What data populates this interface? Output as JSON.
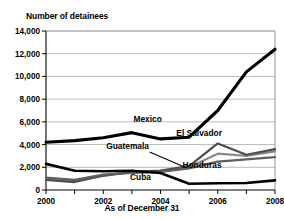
{
  "chart_data": {
    "type": "line",
    "title": "",
    "ylabel": "Number of detainees",
    "xlabel": "As of December 31",
    "x": [
      2000,
      2001,
      2002,
      2003,
      2004,
      2005,
      2006,
      2007,
      2008
    ],
    "x_tick_labels": [
      "2000",
      "2001",
      "2002",
      "2003",
      "2004",
      "2005",
      "2006",
      "2007",
      "2008"
    ],
    "x_tick_labels_shown": [
      "2000",
      "2002",
      "2004",
      "2006",
      "2008"
    ],
    "xlim": [
      2000,
      2008
    ],
    "ylim": [
      0,
      14000
    ],
    "y_ticks": [
      0,
      2000,
      4000,
      6000,
      8000,
      10000,
      12000,
      14000
    ],
    "y_tick_labels": [
      "0",
      "2,000",
      "4,000",
      "6,000",
      "8,000",
      "10,000",
      "12,000",
      "14,000"
    ],
    "grid": true,
    "legend_position": "inline-annotations",
    "series": [
      {
        "name": "Mexico",
        "color": "#000000",
        "width": 3.1,
        "values": [
          4200,
          4350,
          4600,
          5050,
          4500,
          4650,
          7000,
          10400,
          12400
        ]
      },
      {
        "name": "El Salvador",
        "color": "#4d4d4d",
        "width": 2.2,
        "values": [
          900,
          700,
          1250,
          1600,
          1700,
          2100,
          4100,
          3100,
          3600
        ]
      },
      {
        "name": "Guatemala",
        "color": "#8a8a8a",
        "width": 2.2,
        "values": [
          1000,
          800,
          1300,
          1550,
          1650,
          2000,
          3200,
          3000,
          3400
        ]
      },
      {
        "name": "Honduras",
        "color": "#5f5f5f",
        "width": 2.2,
        "values": [
          1100,
          900,
          1350,
          1500,
          1600,
          1900,
          2500,
          2700,
          2900
        ]
      },
      {
        "name": "Cuba",
        "color": "#000000",
        "width": 2.6,
        "values": [
          2300,
          1700,
          1650,
          1700,
          1500,
          550,
          600,
          620,
          850
        ]
      }
    ],
    "annotations": [
      {
        "name": "Mexico",
        "x": 2003.55,
        "y": 6000,
        "leader": false
      },
      {
        "name": "El Salvador",
        "x": 2005.35,
        "y": 4750,
        "leader": false
      },
      {
        "name": "Guatemala",
        "x": 2002.85,
        "y": 3600,
        "leader": true
      },
      {
        "name": "Honduras",
        "x": 2005.45,
        "y": 1900,
        "leader": false
      },
      {
        "name": "Cuba",
        "x": 2003.3,
        "y": 900,
        "leader": false
      }
    ]
  }
}
